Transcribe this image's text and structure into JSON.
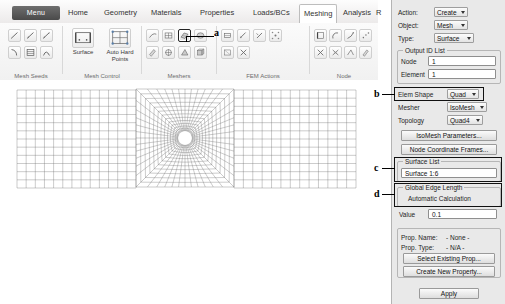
{
  "app": {
    "menu_button": "Menu",
    "tabs": [
      {
        "label": "Home",
        "active": false
      },
      {
        "label": "Geometry",
        "active": false
      },
      {
        "label": "Materials",
        "active": false
      },
      {
        "label": "Properties",
        "active": false
      },
      {
        "label": "Loads/BCs",
        "active": false
      },
      {
        "label": "Meshing",
        "active": true
      },
      {
        "label": "Analysis",
        "active": false
      },
      {
        "label": "R",
        "active": false
      }
    ]
  },
  "ribbon": {
    "groups": [
      {
        "label": "Mesh Seeds"
      },
      {
        "label": "Mesh Control"
      },
      {
        "label": "Meshers"
      },
      {
        "label": "FEM Actions"
      },
      {
        "label": "Node"
      }
    ],
    "mesh_control": [
      {
        "label": "Surface",
        "icon": "surface-mesh-icon"
      },
      {
        "label": "Auto Hard Points",
        "icon": "auto-hard-points-icon"
      }
    ]
  },
  "panel": {
    "action_label": "Action:",
    "action_value": "Create",
    "object_label": "Object:",
    "object_value": "Mesh",
    "type_label": "Type:",
    "type_value": "Surface",
    "output_id_legend": "Output ID List",
    "node_label": "Node",
    "node_value": "1",
    "element_label": "Element",
    "element_value": "1",
    "elem_shape_label": "Elem Shape",
    "elem_shape_value": "Quad",
    "mesher_label": "Mesher",
    "mesher_value": "IsoMesh",
    "topology_label": "Topology",
    "topology_value": "Quad4",
    "isomesh_params_button": "IsoMesh Parameters...",
    "node_coord_frames_button": "Node Coordinate Frames...",
    "surface_list_legend": "Surface List",
    "surface_list_value": "Surface 1:6",
    "global_edge_legend": "Global Edge Length",
    "automatic_calculation_label": "Automatic Calculation",
    "value_label": "Value",
    "value_value": "0.1",
    "prop_name_label": "Prop. Name:",
    "prop_name_value": "- None -",
    "prop_type_label": "Prop. Type:",
    "prop_type_value": "- N/A -",
    "select_existing_prop_button": "Select Existing Prop...",
    "create_new_property_button": "Create New Property...",
    "apply_button": "Apply"
  },
  "annotations": [
    {
      "id": "a",
      "label": "a"
    },
    {
      "id": "b",
      "label": "b"
    },
    {
      "id": "c",
      "label": "c"
    },
    {
      "id": "d",
      "label": "d"
    }
  ],
  "mesh": {
    "description": "quad finite element mesh of a rectangular plate with a central circular hole",
    "hole_center_x": 185,
    "hole_center_y": 138,
    "hole_radius": 7
  },
  "colors": {
    "mesh_line": "#6b6b6b",
    "panel_bg": "#e9e9e9",
    "menu_btn": "#4a4a4a",
    "highlight": "#111111"
  }
}
